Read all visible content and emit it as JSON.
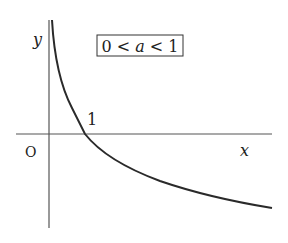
{
  "diagram": {
    "condition_box": {
      "parts": [
        "0",
        " < ",
        "a",
        " < ",
        "1"
      ],
      "text": "0 < a < 1"
    },
    "labels": {
      "x_axis": "x",
      "y_axis": "y",
      "origin": "O",
      "intercept": "1"
    },
    "colors": {
      "axis": "#555555",
      "curve": "#2a2a2a",
      "text": "#222222",
      "background": "#ffffff"
    },
    "geometry": {
      "x_axis": {
        "x1": 16,
        "x2": 272,
        "y": 134
      },
      "y_axis": {
        "x": 49,
        "y1": 20,
        "y2": 228
      },
      "curve_points": [
        [
          52,
          20
        ],
        [
          55,
          50
        ],
        [
          62,
          85
        ],
        [
          72,
          110
        ],
        [
          85,
          134
        ],
        [
          100,
          152
        ],
        [
          120,
          165
        ],
        [
          150,
          178
        ],
        [
          180,
          188
        ],
        [
          220,
          198
        ],
        [
          272,
          208
        ]
      ]
    }
  }
}
